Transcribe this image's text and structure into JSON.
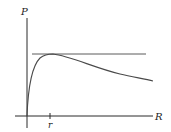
{
  "diagram": {
    "y_axis_label": "P",
    "x_axis_label": "R",
    "tick_label": "r",
    "colors": {
      "axis": "#2a2a2a",
      "curve": "#4a4a4a",
      "asymptote": "#5a5a5a",
      "background": "#ffffff"
    },
    "elements": {
      "y_axis": {
        "x": 27,
        "y_top": 18,
        "y_bottom": 128
      },
      "x_axis": {
        "y": 116,
        "x_left": 15,
        "x_right": 153
      },
      "tick_r": {
        "x": 50
      },
      "horizontal_line": {
        "y": 54,
        "x_left": 32,
        "x_right": 146
      },
      "curve_peak": {
        "x": 52,
        "y": 54
      },
      "curve_end": {
        "x": 153,
        "y": 80
      }
    }
  }
}
